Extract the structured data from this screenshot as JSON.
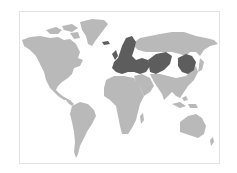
{
  "map": {
    "type": "world-choropleth",
    "projection": "miller-like",
    "colors": {
      "background": "#ffffff",
      "frame": "#e2e2e2",
      "land": "#b9b9b9",
      "highlight": "#5d5d5d"
    },
    "highlighted_regions": [
      "Iceland",
      "Northern Europe",
      "Western Europe",
      "Central Europe",
      "Eastern Europe",
      "Turkey",
      "Kazakhstan",
      "Mongolia"
    ],
    "base_regions": [
      "North America",
      "Greenland",
      "South America",
      "Africa",
      "Middle East",
      "Russia",
      "South Asia",
      "East Asia",
      "Southeast Asia",
      "Australia",
      "New Zealand"
    ]
  }
}
